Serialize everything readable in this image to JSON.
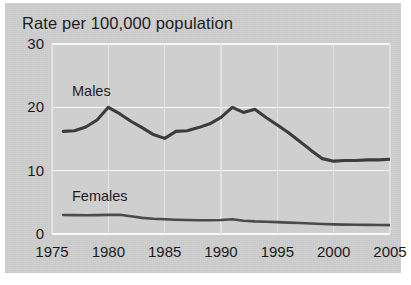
{
  "chart_data": {
    "type": "line",
    "title": "Rate per 100,000 population",
    "xlabel": "",
    "ylabel": "",
    "xlim": [
      1975,
      2005
    ],
    "ylim": [
      0,
      30
    ],
    "grid": true,
    "legend": "inline-labels",
    "x_ticks": [
      "1975",
      "1980",
      "1985",
      "1990",
      "1995",
      "2000",
      "2005"
    ],
    "y_ticks": [
      "0",
      "10",
      "20",
      "30"
    ],
    "x": [
      1976,
      1977,
      1978,
      1979,
      1980,
      1981,
      1982,
      1983,
      1984,
      1985,
      1986,
      1987,
      1988,
      1989,
      1990,
      1991,
      1992,
      1993,
      1994,
      1995,
      1996,
      1997,
      1998,
      1999,
      2000,
      2001,
      2002,
      2003,
      2004,
      2005
    ],
    "series": [
      {
        "name": "Males",
        "color": "#3b3b3b",
        "values": [
          16.2,
          16.3,
          16.9,
          18.0,
          20.0,
          19.0,
          17.8,
          16.8,
          15.7,
          15.1,
          16.2,
          16.3,
          16.8,
          17.4,
          18.4,
          20.0,
          19.2,
          19.7,
          18.4,
          17.2,
          16.0,
          14.6,
          13.2,
          11.9,
          11.5,
          11.6,
          11.6,
          11.7,
          11.7,
          11.8
        ]
      },
      {
        "name": "Females",
        "color": "#4a4a4a",
        "values": [
          3.0,
          2.98,
          2.96,
          2.98,
          3.02,
          3.04,
          2.8,
          2.55,
          2.4,
          2.32,
          2.26,
          2.22,
          2.18,
          2.16,
          2.22,
          2.32,
          2.1,
          2.0,
          1.94,
          1.88,
          1.8,
          1.74,
          1.66,
          1.58,
          1.52,
          1.48,
          1.46,
          1.44,
          1.42,
          1.4
        ]
      }
    ]
  },
  "labels": {
    "males": "Males",
    "females": "Females"
  },
  "colors": {
    "panel_background": "#cfcfcf",
    "plot_background": "#d4d4d4",
    "gridline": "#fdfdfd",
    "line": "#3b3b3b",
    "text": "#1b1b1b"
  }
}
